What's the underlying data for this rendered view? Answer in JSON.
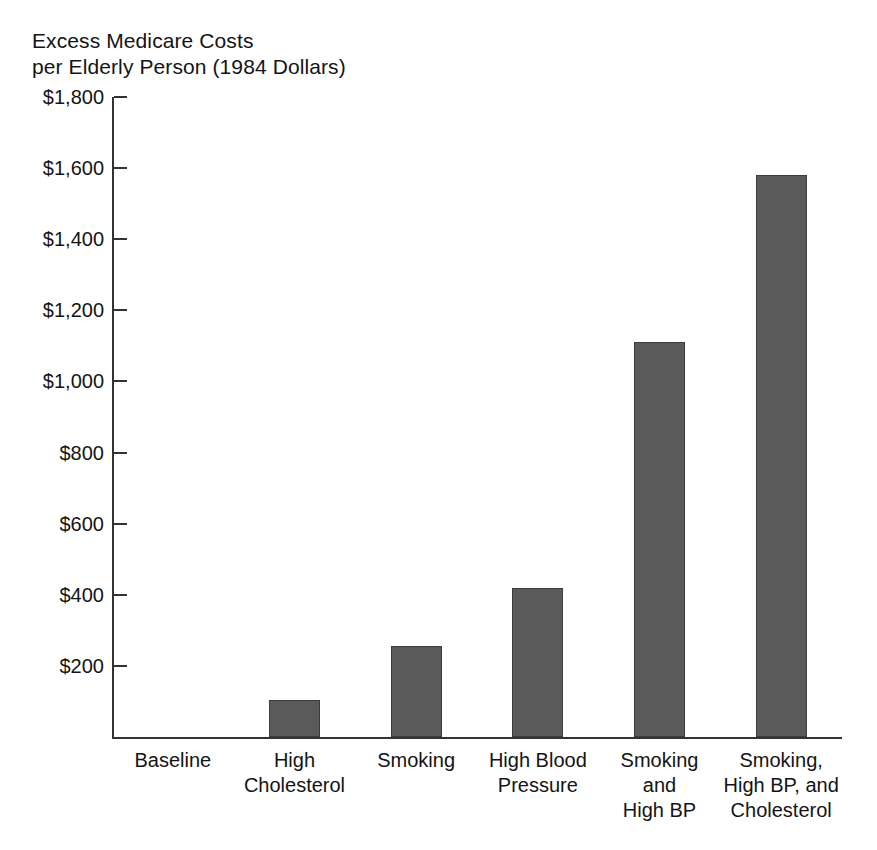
{
  "chart_data": {
    "type": "bar",
    "title": "Excess Medicare Costs\nper Elderly Person (1984 Dollars)",
    "xlabel": "",
    "ylabel": "Excess Medicare Costs per Elderly Person (1984 Dollars)",
    "categories": [
      "Baseline",
      "High\nCholesterol",
      "Smoking",
      "High Blood\nPressure",
      "Smoking\nand\nHigh BP",
      "Smoking,\nHigh BP, and\nCholesterol"
    ],
    "values": [
      0,
      105,
      255,
      420,
      1110,
      1580
    ],
    "ylim": [
      0,
      1800
    ],
    "ytick_values": [
      1800,
      1600,
      1400,
      1200,
      1000,
      800,
      600,
      400,
      200
    ],
    "ytick_labels": [
      "$1,800",
      "$1,600",
      "$1,400",
      "$1,200",
      "$1,000",
      "$800",
      "$600",
      "$400",
      "$200"
    ],
    "grid": false,
    "legend": null,
    "bar_color": "#5a5a5a",
    "bar_edge_color": "#3c3c3c",
    "axis_color": "#333333",
    "background_color": "#ffffff"
  }
}
